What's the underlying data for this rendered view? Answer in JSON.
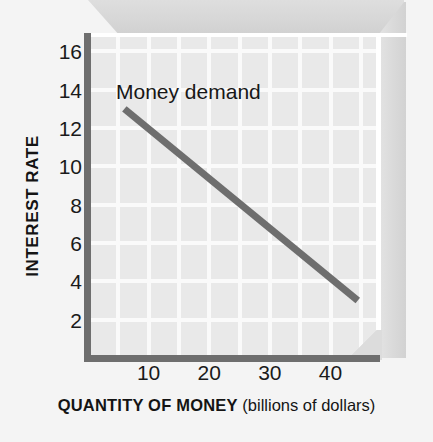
{
  "chart_data": {
    "type": "line",
    "title": "",
    "xlabel": "QUANTITY OF MONEY (billions of dollars)",
    "xlabel_main": "QUANTITY OF MONEY",
    "xlabel_sub": "(billions of dollars)",
    "ylabel": "INTEREST RATE",
    "xlim": [
      0,
      48
    ],
    "ylim": [
      0,
      16.8
    ],
    "grid": true,
    "legend_position": "inline-annotation",
    "xticks": [
      10,
      20,
      30,
      40
    ],
    "xtick_labels": [
      "10",
      "20",
      "30",
      "40"
    ],
    "yticks": [
      2,
      4,
      6,
      8,
      10,
      12,
      14,
      16
    ],
    "ytick_labels": [
      "2",
      "4",
      "6",
      "8",
      "10",
      "12",
      "14",
      "16"
    ],
    "series": [
      {
        "name": "Money demand",
        "annotation": "Money demand",
        "color": "#6e6e6e",
        "x": [
          6,
          44.5
        ],
        "y": [
          13,
          3
        ]
      }
    ],
    "annotations": [
      {
        "text": "Money demand",
        "x": 9,
        "y": 13.6
      }
    ]
  },
  "style": {
    "panel_background": "#e9e9e9",
    "grid_color": "#fafafa",
    "axis_color": "#6e6e6e",
    "line_color": "#6e6e6e",
    "text_color": "#141414",
    "page_background": "#f4f4f4",
    "slab_top_color": "#d8d8d8",
    "slab_side_color": "#dcdcdc"
  }
}
